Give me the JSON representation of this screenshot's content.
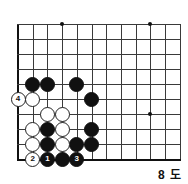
{
  "diagram": {
    "kind": "go-board-diagram",
    "caption": "8 도",
    "board": {
      "origin_x": 18,
      "origin_y": 24,
      "spacing_x": 14.7,
      "spacing_y": 15.0,
      "cols": 12,
      "rows": 10,
      "left_edge": true,
      "bottom_edge": true,
      "star_points": [
        {
          "col": 3,
          "row": 0
        },
        {
          "col": 9,
          "row": 0
        },
        {
          "col": 9,
          "row": 6
        }
      ]
    },
    "stones": [
      {
        "col": 1,
        "row": 4,
        "color": "black",
        "label": ""
      },
      {
        "col": 2,
        "row": 4,
        "color": "black",
        "label": ""
      },
      {
        "col": 4,
        "row": 4,
        "color": "black",
        "label": ""
      },
      {
        "col": 5,
        "row": 5,
        "color": "black",
        "label": ""
      },
      {
        "col": 5,
        "row": 7,
        "color": "black",
        "label": ""
      },
      {
        "col": 5,
        "row": 8,
        "color": "black",
        "label": ""
      },
      {
        "col": 2,
        "row": 7,
        "color": "black",
        "label": ""
      },
      {
        "col": 2,
        "row": 8,
        "color": "black",
        "label": ""
      },
      {
        "col": 2,
        "row": 9,
        "color": "black",
        "label": "1"
      },
      {
        "col": 3,
        "row": 9,
        "color": "black",
        "label": ""
      },
      {
        "col": 4,
        "row": 9,
        "color": "black",
        "label": "3"
      },
      {
        "col": 4,
        "row": 8,
        "color": "black",
        "label": ""
      },
      {
        "col": 1,
        "row": 5,
        "color": "white",
        "label": ""
      },
      {
        "col": 2,
        "row": 6,
        "color": "white",
        "label": ""
      },
      {
        "col": 3,
        "row": 6,
        "color": "white",
        "label": ""
      },
      {
        "col": 1,
        "row": 7,
        "color": "white",
        "label": ""
      },
      {
        "col": 3,
        "row": 7,
        "color": "white",
        "label": ""
      },
      {
        "col": 1,
        "row": 8,
        "color": "white",
        "label": ""
      },
      {
        "col": 3,
        "row": 8,
        "color": "white",
        "label": ""
      },
      {
        "col": 1,
        "row": 9,
        "color": "white",
        "label": "2"
      },
      {
        "col": 0,
        "row": 5,
        "color": "white",
        "label": "4"
      }
    ]
  }
}
